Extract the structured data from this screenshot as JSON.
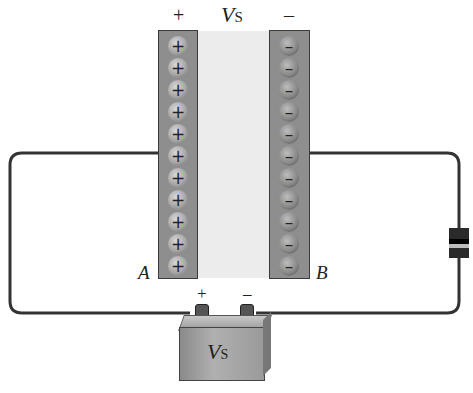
{
  "diagram": {
    "title_voltage": {
      "symbol": "V",
      "subscript": "S"
    },
    "top_polarity": {
      "plus": "+",
      "minus": "–"
    },
    "plate_a": {
      "label": "A",
      "charge_symbol": "+",
      "charge_count": 11
    },
    "plate_b": {
      "label": "B",
      "charge_symbol": "–",
      "charge_count": 11
    },
    "battery": {
      "label": {
        "symbol": "V",
        "subscript": "S"
      },
      "plus": "+",
      "minus": "–"
    },
    "components": [
      "capacitor-plate-a",
      "dielectric-gap",
      "capacitor-plate-b",
      "resistor",
      "battery",
      "wires"
    ]
  },
  "colors": {
    "plate": "#8e8e8e",
    "dielectric": "#ececec",
    "wire": "#333333",
    "resistor_body": "#2a2a2a",
    "resistor_band": "#bcbcbc"
  }
}
